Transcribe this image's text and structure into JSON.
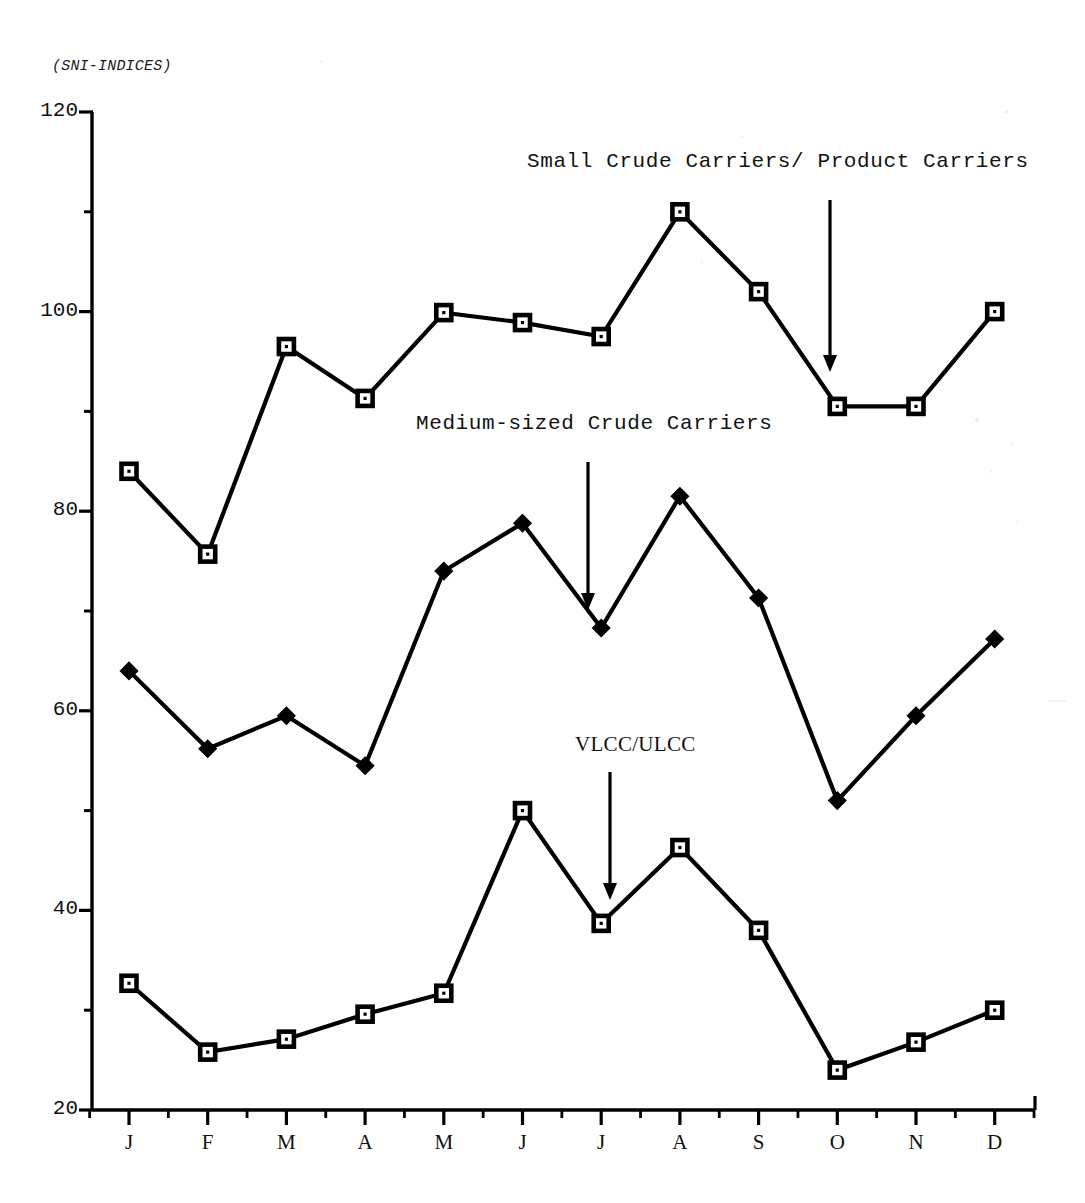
{
  "chart_data": {
    "type": "line",
    "title": "",
    "subtitle": "",
    "unit_label": "(SNI-INDICES)",
    "xlabel": "",
    "ylabel": "",
    "categories": [
      "J",
      "F",
      "M",
      "A",
      "M",
      "J",
      "J",
      "A",
      "S",
      "O",
      "N",
      "D"
    ],
    "xtick_labels": [
      "J",
      "F",
      "M",
      "A",
      "M",
      "J",
      "J",
      "A",
      "S",
      "O",
      "N",
      "D"
    ],
    "ytick_labels": [
      "120",
      "100",
      "80",
      "60",
      "40",
      "20"
    ],
    "ytick_values": [
      120,
      100,
      80,
      60,
      40,
      20
    ],
    "yminor_values": [
      110,
      90,
      70,
      50,
      30
    ],
    "ylim": [
      20,
      120
    ],
    "grid": false,
    "legend": "annotations-with-arrows",
    "series": [
      {
        "name": "Small Crude Carriers/ Product Carriers",
        "marker": "open-square",
        "color": "#000000",
        "values": [
          84.0,
          75.7,
          96.5,
          91.3,
          99.9,
          98.9,
          97.5,
          110.0,
          102.0,
          90.5,
          90.5,
          100.0
        ]
      },
      {
        "name": "Medium-sized Crude Carriers",
        "marker": "filled-diamond",
        "color": "#000000",
        "values": [
          64.0,
          56.2,
          59.5,
          54.5,
          74.0,
          78.8,
          68.3,
          81.5,
          71.3,
          51.0,
          59.5,
          67.2
        ]
      },
      {
        "name": "VLCC/ULCC",
        "marker": "open-square",
        "color": "#000000",
        "values": [
          32.7,
          25.8,
          27.1,
          29.6,
          31.7,
          50.0,
          38.7,
          46.3,
          38.0,
          24.0,
          26.8,
          30.0
        ]
      }
    ],
    "annotations": [
      {
        "text": "Small Crude Carriers/ Product Carriers",
        "font": "mono",
        "label_x": 527,
        "label_y": 150,
        "arrow_x": 830,
        "arrow_y_start": 200,
        "arrow_y_end": 372
      },
      {
        "text": "Medium-sized Crude Carriers",
        "font": "mono",
        "label_x": 416,
        "label_y": 412,
        "arrow_x": 588,
        "arrow_y_start": 462,
        "arrow_y_end": 610
      },
      {
        "text": "VLCC/ULCC",
        "font": "serif",
        "label_x": 575,
        "label_y": 732,
        "arrow_x": 610,
        "arrow_y_start": 772,
        "arrow_y_end": 900
      }
    ]
  }
}
